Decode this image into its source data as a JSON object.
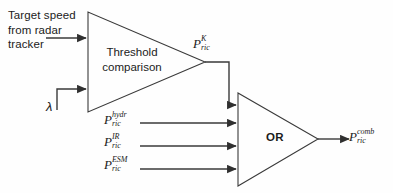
{
  "diagram": {
    "background_color": "#fefefe",
    "line_color": "#3a3a3a",
    "text_color": "#1b1b1b",
    "inputs": {
      "target_speed_caption": "Target speed from radar tracker",
      "lambda_symbol": "λ"
    },
    "blocks": {
      "threshold": {
        "label": "Threshold comparison",
        "shape": "triangle"
      },
      "or_gate": {
        "label": "OR",
        "shape": "triangle"
      }
    },
    "signals": {
      "k": {
        "base": "P",
        "sub": "ric",
        "sup": "K"
      },
      "hydr": {
        "base": "P",
        "sub": "ric",
        "sup": "hydr"
      },
      "ir": {
        "base": "P",
        "sub": "ric",
        "sup": "IR"
      },
      "esm": {
        "base": "P",
        "sub": "ric",
        "sup": "ESM"
      },
      "comb": {
        "base": "P",
        "sub": "ric",
        "sup": "comb"
      }
    }
  }
}
